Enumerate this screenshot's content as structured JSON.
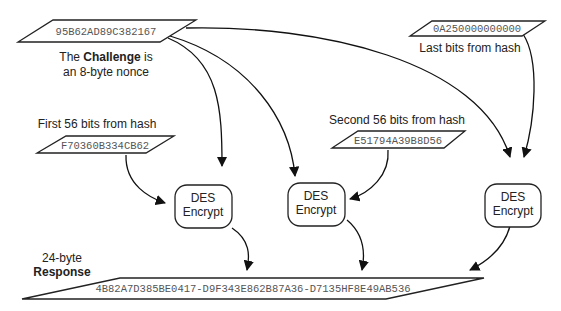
{
  "challenge": {
    "value": "95B62AD89C382167",
    "caption_prefix": "The ",
    "caption_bold": "Challenge",
    "caption_suffix": " is",
    "caption_line2": "an 8-byte nonce"
  },
  "hash_parts": [
    {
      "label": "First 56 bits from hash",
      "value": "F70360B334CB62"
    },
    {
      "label": "Second 56 bits from hash",
      "value": "E51794A39B8D56"
    },
    {
      "label": "Last bits from hash",
      "value": "0A250000000000"
    }
  ],
  "des_boxes": [
    {
      "line1": "DES",
      "line2": "Encrypt"
    },
    {
      "line1": "DES",
      "line2": "Encrypt"
    },
    {
      "line1": "DES",
      "line2": "Encrypt"
    }
  ],
  "response": {
    "size_label": "24-byte",
    "bold_label": "Response",
    "value": "4B82A7D385BE0417-D9F343E862B87A36-D7135HF8E49AB536"
  }
}
